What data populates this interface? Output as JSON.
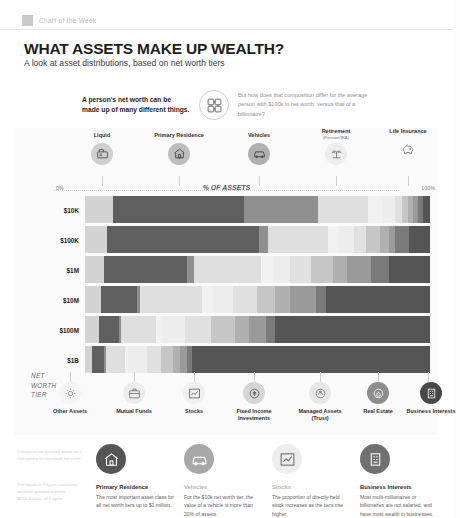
{
  "brand": {
    "label": "Chart of the Week"
  },
  "header": {
    "title": "WHAT ASSETS MAKE UP WEALTH?",
    "subtitle": "A look at asset distributions, based on net worth tiers"
  },
  "intro": {
    "statement": "A person's net worth can be made up of many different things.",
    "question": "But how does that composition differ for the average person with $100k in net worth, versus that of a billionaire?",
    "icon": "puzzle-icon"
  },
  "axis": {
    "start": "0%",
    "end": "100%",
    "title": "% OF ASSETS",
    "tier_axis_label": "NET WORTH TIER"
  },
  "legend_top": [
    {
      "label": "Liquid",
      "sub": "",
      "icon": "cash-register-icon",
      "color": "#8a8a8a"
    },
    {
      "label": "Primary Residence",
      "sub": "",
      "icon": "house-icon",
      "color": "#6e6e6e"
    },
    {
      "label": "Vehicles",
      "sub": "",
      "icon": "car-icon",
      "color": "#909090"
    },
    {
      "label": "Retirement",
      "sub": "(Pension/IRA)",
      "icon": "palm-tree-icon",
      "color": "#dcdcdc"
    },
    {
      "label": "Life Insurance",
      "sub": "",
      "icon": "piggy-bank-icon",
      "color": "#efefef"
    }
  ],
  "legend_bottom": [
    {
      "label": "Other Assets",
      "sub": "",
      "icon": "gear-sun-icon",
      "color": "#f2f2f2"
    },
    {
      "label": "Mutual Funds",
      "sub": "",
      "icon": "briefcase-icon",
      "color": "#e4e4e4"
    },
    {
      "label": "Stocks",
      "sub": "",
      "icon": "stock-chart-icon",
      "color": "#cdcdcd"
    },
    {
      "label": "Fixed Income Investments",
      "sub": "",
      "icon": "bond-coin-icon",
      "color": "#b4b4b4"
    },
    {
      "label": "Managed Assets (Trust)",
      "sub": "",
      "icon": "trust-coin-icon",
      "color": "#9b9b9b"
    },
    {
      "label": "Real Estate",
      "sub": "",
      "icon": "real-estate-coin-icon",
      "color": "#7c7c7c"
    },
    {
      "label": "Business Interests",
      "sub": "",
      "icon": "business-icon",
      "color": "#575757"
    }
  ],
  "chart_data": {
    "type": "bar",
    "title": "% OF ASSETS",
    "xlabel": "% OF ASSETS",
    "ylabel": "NET WORTH TIER",
    "xlim": [
      0,
      100
    ],
    "grid": false,
    "legend_position": "top-and-bottom",
    "stacked": true,
    "categories": [
      "$10K",
      "$100K",
      "$1M",
      "$10M",
      "$100M",
      "$1B"
    ],
    "series": [
      {
        "name": "Liquid",
        "color": "#d3d3d3",
        "values": [
          8.0,
          6.5,
          5.5,
          4.5,
          4.0,
          2.0
        ]
      },
      {
        "name": "Primary Residence",
        "color": "#5f5f5f",
        "values": [
          38.0,
          44.0,
          24.0,
          10.5,
          6.0,
          3.5
        ]
      },
      {
        "name": "Vehicles",
        "color": "#8f8f8f",
        "values": [
          21.5,
          2.5,
          2.0,
          1.0,
          0.5,
          0.5
        ]
      },
      {
        "name": "Retirement (Pension/IRA)",
        "color": "#dedede",
        "values": [
          14.5,
          17.5,
          19.5,
          18.0,
          10.0,
          5.5
        ]
      },
      {
        "name": "Life Insurance",
        "color": "#f1f1f1",
        "values": [
          4.5,
          3.0,
          3.5,
          3.0,
          2.0,
          1.0
        ]
      },
      {
        "name": "Other Assets",
        "color": "#ededed",
        "values": [
          3.5,
          4.5,
          5.0,
          6.0,
          6.5,
          5.5
        ]
      },
      {
        "name": "Mutual Funds",
        "color": "#e0e0e0",
        "values": [
          2.0,
          3.5,
          6.0,
          7.0,
          7.5,
          4.0
        ]
      },
      {
        "name": "Stocks",
        "color": "#c6c6c6",
        "values": [
          1.5,
          4.0,
          6.5,
          5.0,
          7.0,
          3.5
        ]
      },
      {
        "name": "Fixed Income Investments",
        "color": "#b0b0b0",
        "values": [
          1.5,
          2.5,
          4.0,
          4.5,
          4.0,
          2.0
        ]
      },
      {
        "name": "Managed Assets (Trust)",
        "color": "#9a9a9a",
        "values": [
          1.5,
          2.0,
          7.0,
          7.5,
          5.0,
          2.0
        ]
      },
      {
        "name": "Real Estate",
        "color": "#7a7a7a",
        "values": [
          1.5,
          4.0,
          5.0,
          3.0,
          2.5,
          1.5
        ]
      },
      {
        "name": "Business Interests",
        "color": "#555555",
        "values": [
          2.0,
          6.0,
          12.0,
          30.0,
          45.0,
          69.0
        ]
      }
    ]
  },
  "footnotes": {
    "note1": "Categories are grouped based on a high variety of household net worth.",
    "note2": "The figures in 5 figure increments would be grouped together ($10k-$100k), all 6 figure"
  },
  "cards": [
    {
      "title": "Primary Residence",
      "body": "The most important asset class for all net worth tiers up to $1 million.",
      "icon": "house-circle-icon",
      "color": "#555555",
      "muted": false
    },
    {
      "title": "Vehicles",
      "body": "For the $10k net worth tier, the value of a vehicle is more than 20% of assets.",
      "icon": "car-circle-icon",
      "color": "#a8a8a8",
      "muted": true
    },
    {
      "title": "Stocks",
      "body": "The proportion of directly-held stock increases as the tiers rise higher.",
      "icon": "stock-circle-icon",
      "color": "#ededed",
      "muted": true
    },
    {
      "title": "Business Interests",
      "body": "Most multi-millionaires or billionaires are not salaried, and have most wealth in businesses.",
      "icon": "business-circle-icon",
      "color": "#707070",
      "muted": false
    }
  ]
}
